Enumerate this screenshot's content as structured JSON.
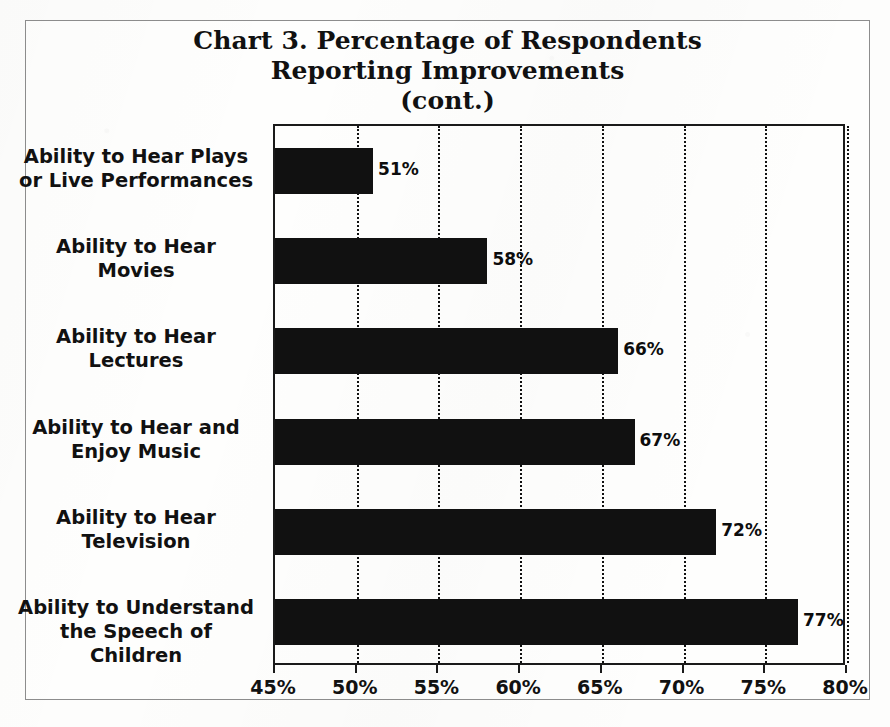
{
  "title": {
    "lines": [
      "Chart 3. Percentage of Respondents",
      "Reporting Improvements",
      "(cont.)"
    ]
  },
  "axis": {
    "tick_labels": [
      "45%",
      "50%",
      "55%",
      "60%",
      "65%",
      "70%",
      "75%",
      "80%"
    ]
  },
  "bar_labels": [
    "51%",
    "58%",
    "66%",
    "67%",
    "72%",
    "77%"
  ],
  "categories": [
    {
      "lines": [
        "Ability to Hear Plays",
        "or Live Performances"
      ]
    },
    {
      "lines": [
        "Ability to Hear",
        "Movies"
      ]
    },
    {
      "lines": [
        "Ability to Hear",
        "Lectures"
      ]
    },
    {
      "lines": [
        "Ability to Hear and",
        "Enjoy Music"
      ]
    },
    {
      "lines": [
        "Ability to Hear",
        "Television"
      ]
    },
    {
      "lines": [
        "Ability to Understand",
        "the Speech of Children"
      ]
    }
  ],
  "colors": {
    "bar": "#111111",
    "background": "#fdfdfc",
    "frame": "#8d8d8d",
    "axis": "#1a1a1a",
    "text": "#111111"
  },
  "chart_data": {
    "type": "bar",
    "orientation": "horizontal",
    "title": "Chart 3. Percentage of Respondents Reporting Improvements (cont.)",
    "xlabel": "",
    "ylabel": "",
    "categories": [
      "Ability to Hear Plays or Live Performances",
      "Ability to Hear Movies",
      "Ability to Hear Lectures",
      "Ability to Hear and Enjoy Music",
      "Ability to Hear Television",
      "Ability to Understand the Speech of Children"
    ],
    "values": [
      51,
      58,
      66,
      67,
      72,
      77
    ],
    "value_labels": [
      "51%",
      "58%",
      "66%",
      "67%",
      "72%",
      "77%"
    ],
    "xlim": [
      45,
      80
    ],
    "xticks": [
      45,
      50,
      55,
      60,
      65,
      70,
      75,
      80
    ],
    "xtick_labels": [
      "45%",
      "50%",
      "55%",
      "60%",
      "65%",
      "70%",
      "75%",
      "80%"
    ],
    "units": "percent",
    "grid": {
      "vertical": true,
      "horizontal": false,
      "style": "dotted"
    },
    "legend": null,
    "series_color": "#111111"
  }
}
